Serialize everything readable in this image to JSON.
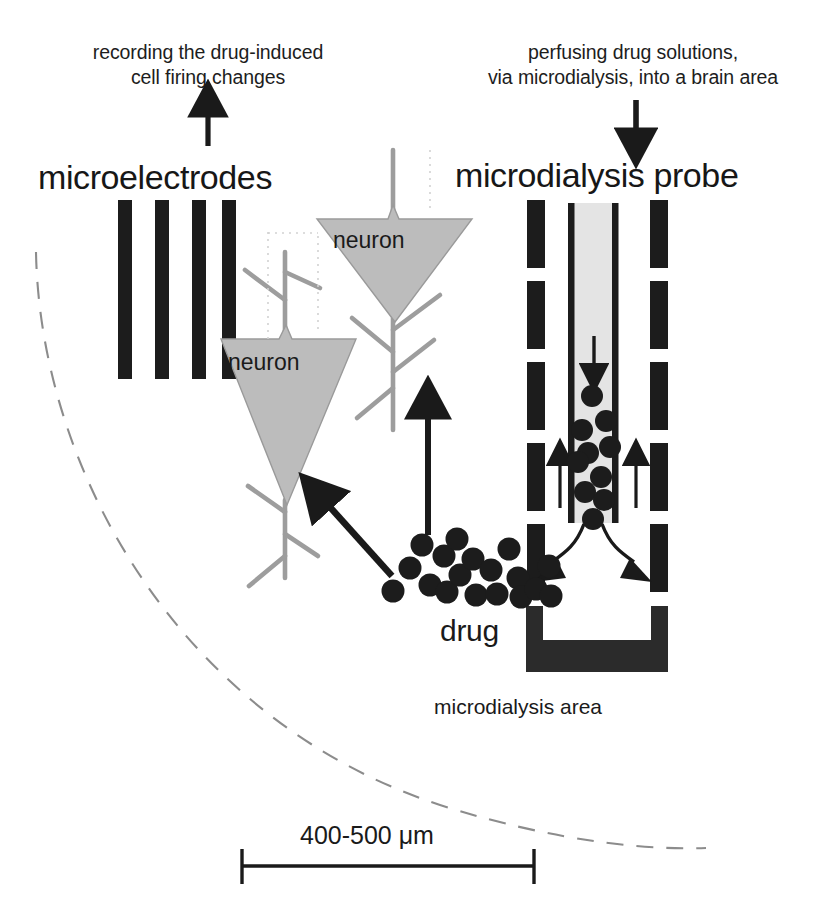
{
  "figure": {
    "kind": "scientific-diagram",
    "captions": {
      "left": "recording the drug-induced\ncell firing changes",
      "right": "perfusing drug solutions,\nvia microdialysis, into a brain area"
    },
    "headings": {
      "left": "microelectrodes",
      "right": "microdialysis probe"
    },
    "labels": {
      "neuron_upper": "neuron",
      "neuron_lower": "neuron",
      "drug": "drug",
      "microdialysis_area": "microdialysis area",
      "scale": "400-500 μm"
    },
    "colors": {
      "ink": "#1a1a1a",
      "bar_fill": "#1c1c1c",
      "neuron_fill": "#b9b9b9",
      "neuron_stroke": "#8f8f8f",
      "tube_fill": "#e2e2e2",
      "tube_wall": "#1c1c1c",
      "brain_boundary": "#8c8c8c",
      "background": "#ffffff"
    },
    "geometry": {
      "canvas": [
        830,
        911
      ],
      "microelectrodes": {
        "count": 4,
        "bars_x": [
          118,
          155,
          193,
          221
        ],
        "bar_width": 14,
        "bar_top": 200,
        "bar_bottom": 378
      },
      "probe": {
        "dashed_wall_left_x": 527,
        "dashed_wall_right_x": 650,
        "dashed_wall_width": 18,
        "dash_length": 68,
        "dash_gap": 13,
        "dash_top": 200,
        "dash_count": 6,
        "inner_tube_x": [
          571,
          618
        ],
        "inner_tube_top": 203,
        "inner_tube_bottom": 522,
        "base_top": 608,
        "base_bottom": 672
      },
      "scale_bar": {
        "x1": 240,
        "x2": 535,
        "y": 866,
        "cap_height": 34
      }
    },
    "arrows": {
      "recording_up": {
        "x": 208,
        "y1": 143,
        "y2": 100
      },
      "perfusion_down": {
        "x": 636,
        "y1": 103,
        "y2": 146
      },
      "inflow_down_in_tube": {
        "x": 594,
        "y1": 340,
        "y2": 378
      },
      "outflow_up_left": {
        "x": 560,
        "y1": 505,
        "y2": 452
      },
      "outflow_up_right": {
        "x": 636,
        "y1": 505,
        "y2": 452
      },
      "drug_up": {
        "x": 428,
        "y1": 533,
        "y2": 400
      },
      "drug_to_neuron": {
        "x1": 392,
        "y1": 574,
        "x2": 314,
        "y2": 488
      },
      "diffusion_left": "curved arrow from probe tip to lower-left",
      "diffusion_right": "curved arrow from probe tip to lower-right"
    },
    "particles": {
      "inside_tube": [
        [
          592,
          396
        ],
        [
          582,
          428
        ],
        [
          605,
          420
        ],
        [
          590,
          452
        ],
        [
          612,
          447
        ],
        [
          578,
          460
        ],
        [
          600,
          476
        ],
        [
          585,
          492
        ],
        [
          604,
          500
        ],
        [
          593,
          518
        ]
      ],
      "outside_cloud": [
        [
          394,
          591
        ],
        [
          409,
          570
        ],
        [
          421,
          545
        ],
        [
          432,
          584
        ],
        [
          444,
          556
        ],
        [
          447,
          592
        ],
        [
          455,
          539
        ],
        [
          459,
          575
        ],
        [
          472,
          560
        ],
        [
          474,
          595
        ],
        [
          490,
          570
        ],
        [
          496,
          594
        ],
        [
          508,
          549
        ],
        [
          517,
          579
        ],
        [
          520,
          597
        ],
        [
          535,
          589
        ],
        [
          543,
          566
        ],
        [
          549,
          595
        ],
        [
          556,
          579
        ]
      ],
      "radius": 11.5
    },
    "neurons": [
      {
        "name": "neuron_upper",
        "apex": [
          395,
          320
        ],
        "left": [
          317,
          218
        ],
        "right": [
          472,
          218
        ]
      },
      {
        "name": "neuron_lower",
        "apex": [
          286,
          503
        ],
        "left": [
          221,
          338
        ],
        "right": [
          356,
          338
        ]
      }
    ],
    "brain_boundary": "dashed arc sweeping from upper-left (38,255) to lower-right (700,845)"
  }
}
